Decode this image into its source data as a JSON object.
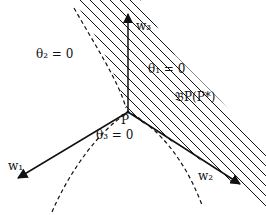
{
  "diagram": {
    "colors": {
      "stroke": "#111111",
      "background": "#ffffff"
    },
    "point": {
      "label": "P",
      "x": 128,
      "y": 112
    },
    "vectors": [
      {
        "name": "w1",
        "label": "w₁",
        "from": [
          128,
          112
        ],
        "to": [
          18,
          178
        ]
      },
      {
        "name": "w2",
        "label": "w₂",
        "from": [
          128,
          112
        ],
        "to": [
          240,
          184
        ]
      },
      {
        "name": "w3",
        "label": "w₃",
        "from": [
          128,
          112
        ],
        "to": [
          128,
          14
        ]
      }
    ],
    "regions": [
      {
        "name": "theta2",
        "label": "θ₂ = 0"
      },
      {
        "name": "theta1",
        "label": "θ₁ = 0"
      },
      {
        "name": "theta3",
        "label": "θ₃ = 0"
      }
    ],
    "hatched_region_label": "𝔅P(P*)"
  }
}
